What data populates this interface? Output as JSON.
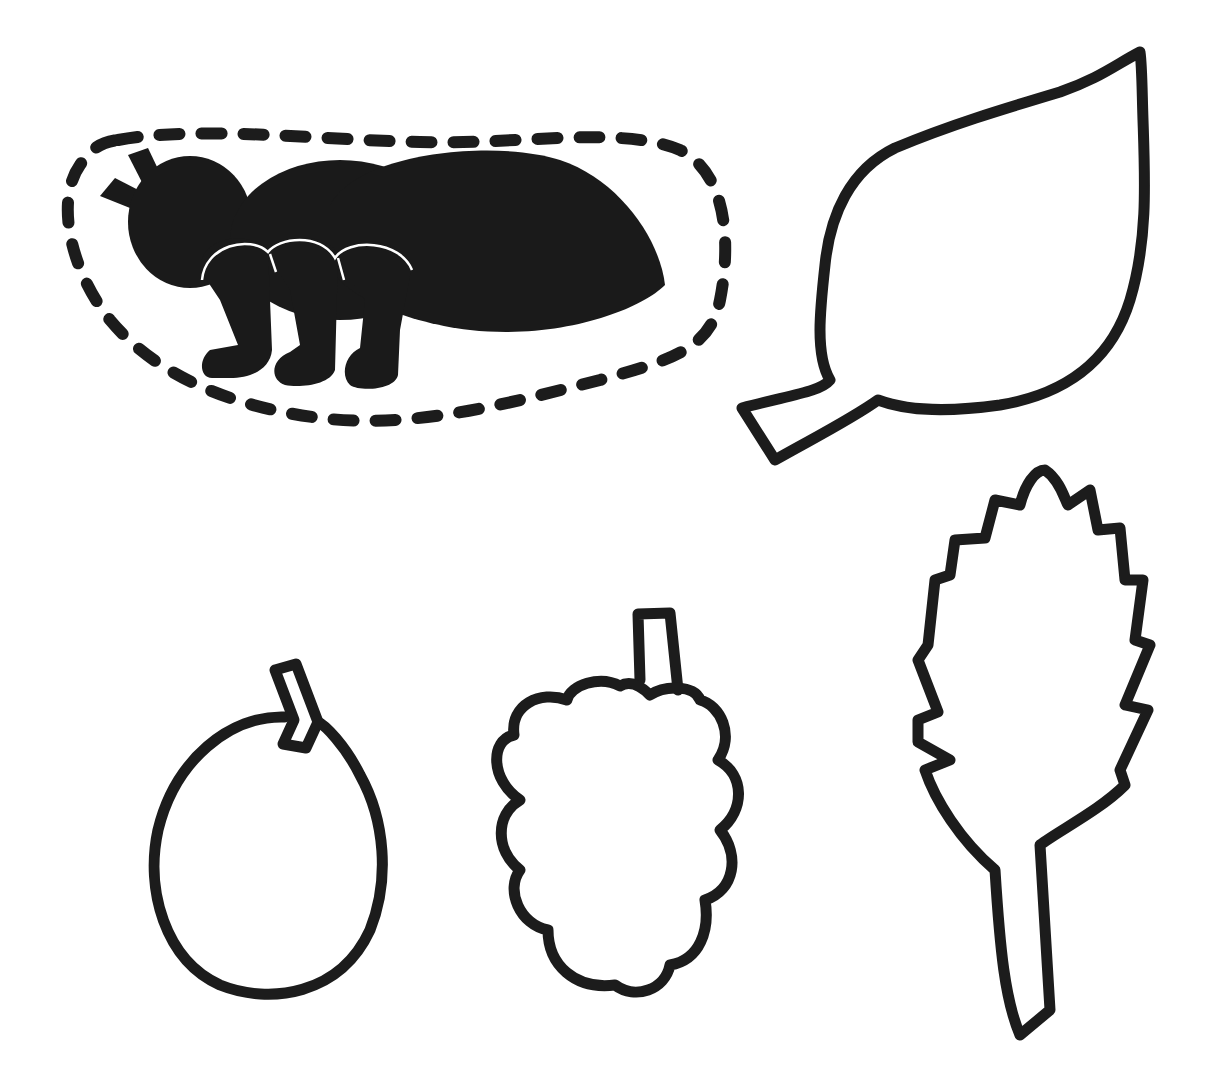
{
  "page": {
    "background": "#ffffff",
    "ink_color": "#1c1c1c"
  },
  "figures": [
    {
      "name": "ant-silhouette",
      "style": "solid-black",
      "enclosed_by": "dashed-outline"
    },
    {
      "name": "smooth-leaf",
      "style": "outline"
    },
    {
      "name": "round-fruit",
      "style": "outline"
    },
    {
      "name": "mulberry",
      "style": "outline"
    },
    {
      "name": "serrated-leaf",
      "style": "outline"
    }
  ]
}
